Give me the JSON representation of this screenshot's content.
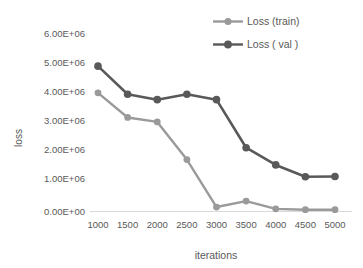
{
  "chart_data": {
    "type": "line",
    "title": "",
    "xlabel": "iterations",
    "ylabel": "loss",
    "categories": [
      "1000",
      "1500",
      "2000",
      "2500",
      "3000",
      "3500",
      "4000",
      "4500",
      "5000"
    ],
    "ylim": [
      0,
      6000000
    ],
    "ytick_labels": [
      "0.00E+00",
      "1.00E+06",
      "2.00E+06",
      "3.00E+06",
      "4.00E+06",
      "5.00E+06",
      "6.00E+06"
    ],
    "ytick_values": [
      0,
      1000000,
      2000000,
      3000000,
      4000000,
      5000000,
      6000000
    ],
    "grid": false,
    "legend_position": "top-right",
    "series": [
      {
        "name": "Loss (train)",
        "color": "#9a9a9a",
        "values": [
          4000000,
          3170000,
          3020000,
          1750000,
          150000,
          350000,
          90000,
          60000,
          60000
        ]
      },
      {
        "name": "Loss ( val )",
        "color": "#595959",
        "values": [
          4900000,
          3950000,
          3770000,
          3950000,
          3770000,
          2150000,
          1570000,
          1170000,
          1180000
        ]
      }
    ]
  },
  "legend": {
    "items": [
      {
        "label": "Loss (train)"
      },
      {
        "label": "Loss ( val )"
      }
    ]
  },
  "axes": {
    "x_title": "iterations",
    "y_title": "loss"
  }
}
